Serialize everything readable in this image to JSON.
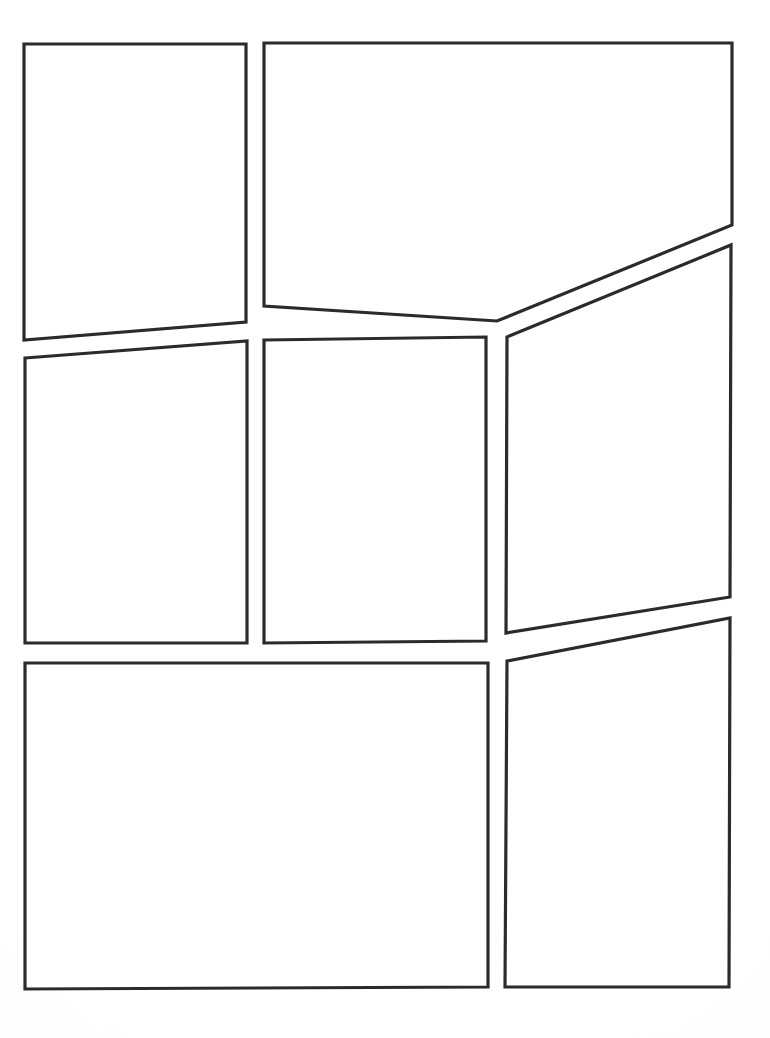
{
  "document": {
    "kind": "blank-comic-page-template",
    "title": "",
    "page_width": 770,
    "page_height": 1038,
    "background_color": "#ffffff",
    "paper_tone_color": "#fafaf9",
    "panel_border_color": "#2b2b2d",
    "panel_fill_color": "#ffffff",
    "panel_border_width": 3.2,
    "panel_count": 8,
    "visible_text": "",
    "rows": [
      {
        "label": "row-1",
        "panel_ids": [
          "panel-1",
          "panel-2"
        ]
      },
      {
        "label": "row-2",
        "panel_ids": [
          "panel-3",
          "panel-4",
          "panel-5"
        ]
      },
      {
        "label": "row-3",
        "panel_ids": [
          "panel-6",
          "panel-7"
        ]
      }
    ]
  },
  "panels": [
    {
      "id": "panel-1",
      "name": "panel-row1-left",
      "row": 1,
      "column": 1,
      "shape": "quadrilateral",
      "points": "24,44 246,44 246,322 24,340"
    },
    {
      "id": "panel-2",
      "name": "panel-row1-right",
      "row": 1,
      "column": 2,
      "shape": "pentagon",
      "points": "264,43 732,43 732,225 497,321 264,306"
    },
    {
      "id": "panel-3",
      "name": "panel-row2-left",
      "row": 2,
      "column": 1,
      "shape": "quadrilateral",
      "points": "25,358 247,341 247,643 25,643"
    },
    {
      "id": "panel-4",
      "name": "panel-row2-center",
      "row": 2,
      "column": 2,
      "shape": "quadrilateral",
      "points": "264,340 486,337 486,641 264,643"
    },
    {
      "id": "panel-5",
      "name": "panel-row2-right",
      "row": 2,
      "column": 3,
      "shape": "quadrilateral",
      "points": "507,337 731,245 730,597 506,633"
    },
    {
      "id": "panel-6",
      "name": "panel-row3-left",
      "row": 3,
      "column": 1,
      "shape": "quadrilateral",
      "points": "25,663 488,663 488,987 25,989"
    },
    {
      "id": "panel-7",
      "name": "panel-row3-right",
      "row": 3,
      "column": 2,
      "shape": "quadrilateral",
      "points": "507,661 730,618 729,987 505,987"
    }
  ],
  "extra_panels": [
    {
      "id": "panel-8",
      "name": "panel-row2-right-upper-sliver",
      "note": "right column upper panel continues above the diagonal gutter",
      "points": ""
    }
  ]
}
